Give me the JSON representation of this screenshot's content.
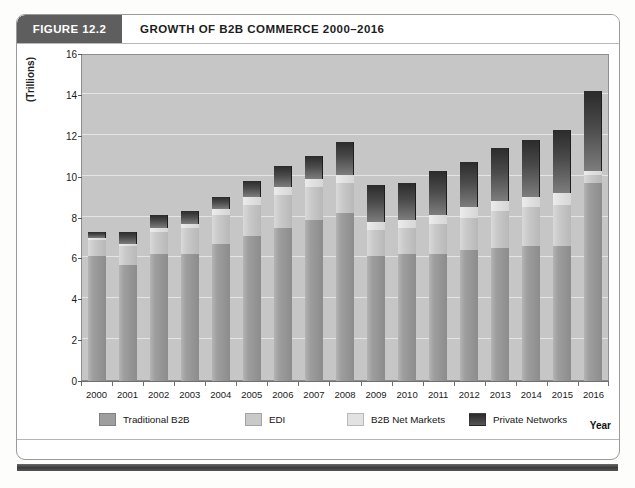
{
  "figure": {
    "tag": "FIGURE 12.2",
    "title": "GROWTH OF B2B COMMERCE 2000–2016"
  },
  "axis": {
    "y_label": "(Trillions)",
    "x_label": "Year"
  },
  "colors": {
    "traditional_b2b": "#9e9e9e",
    "edi": "#c9c9c9",
    "b2b_net_markets": "#e2e2e2",
    "private_networks": "#3a3a3a",
    "plot_background": "#c6c6c6",
    "gridline": "#e4e4e4",
    "header_tag_background": "#5e5e5e"
  },
  "chart_data": {
    "type": "bar",
    "stacked": true,
    "title": "GROWTH OF B2B COMMERCE 2000–2016",
    "xlabel": "Year",
    "ylabel": "(Trillions)",
    "ylim": [
      0,
      16
    ],
    "yticks": [
      0,
      2,
      4,
      6,
      8,
      10,
      12,
      14,
      16
    ],
    "grid": true,
    "legend_position": "bottom",
    "categories": [
      "2000",
      "2001",
      "2002",
      "2003",
      "2004",
      "2005",
      "2006",
      "2007",
      "2008",
      "2009",
      "2010",
      "2011",
      "2012",
      "2013",
      "2014",
      "2015",
      "2016"
    ],
    "series": [
      {
        "name": "Traditional B2B",
        "values": [
          6.1,
          5.7,
          6.2,
          6.2,
          6.7,
          7.1,
          7.5,
          7.9,
          8.2,
          6.1,
          6.2,
          6.2,
          6.4,
          6.5,
          6.6,
          6.6,
          9.7
        ]
      },
      {
        "name": "EDI",
        "values": [
          0.8,
          0.9,
          1.1,
          1.3,
          1.4,
          1.5,
          1.6,
          1.6,
          1.5,
          1.3,
          1.3,
          1.5,
          1.6,
          1.8,
          1.9,
          2.0,
          0.4
        ]
      },
      {
        "name": "B2B Net Markets",
        "values": [
          0.1,
          0.1,
          0.2,
          0.2,
          0.3,
          0.4,
          0.4,
          0.4,
          0.4,
          0.4,
          0.4,
          0.4,
          0.5,
          0.5,
          0.5,
          0.6,
          0.2
        ]
      },
      {
        "name": "Private Networks",
        "values": [
          0.3,
          0.6,
          0.6,
          0.6,
          0.6,
          0.8,
          1.0,
          1.1,
          1.6,
          1.8,
          1.8,
          2.2,
          2.2,
          2.6,
          2.8,
          3.1,
          3.9
        ]
      }
    ],
    "totals": [
      7.3,
      7.3,
      8.1,
      8.3,
      9.0,
      9.8,
      10.5,
      11.0,
      11.7,
      9.6,
      9.7,
      10.3,
      10.7,
      11.4,
      11.8,
      12.3,
      14.2
    ]
  }
}
